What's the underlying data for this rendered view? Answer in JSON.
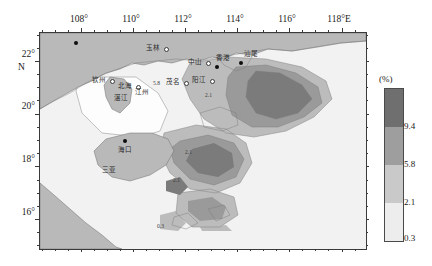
{
  "figure": {
    "name": "south-china-sea-percentage-contour-map",
    "axes": {
      "x_ticks": [
        {
          "label": "108°",
          "lon": 108
        },
        {
          "label": "110°",
          "lon": 110
        },
        {
          "label": "112°",
          "lon": 112
        },
        {
          "label": "114°",
          "lon": 114
        },
        {
          "label": "116°",
          "lon": 116
        },
        {
          "label": "118°E",
          "lon": 118,
          "bold_suffix": "E"
        }
      ],
      "y_ticks": [
        {
          "label": "22°",
          "lat": 22,
          "sublabel": "N"
        },
        {
          "label": "20°",
          "lat": 20
        },
        {
          "label": "18°",
          "lat": 18
        },
        {
          "label": "16°",
          "lat": 16
        }
      ],
      "x_range": [
        106.4,
        118.9
      ],
      "y_range": [
        14.9,
        23.1
      ]
    },
    "colorbar": {
      "title": "(%)",
      "ticks": [
        "9.4",
        "5.8",
        "2.1",
        "0.3"
      ],
      "band_colors": [
        "#6f6f6f",
        "#9e9e9e",
        "#c9c9c9",
        "#ededed"
      ]
    },
    "places": [
      {
        "name": "玉林",
        "marker": "open",
        "x": 106,
        "y": 16
      },
      {
        "name": "钦州",
        "marker": "open",
        "x": 59,
        "y": 48
      },
      {
        "name": "北海",
        "marker": "open",
        "x": 84,
        "y": 52
      },
      {
        "name": "江州",
        "marker": "none",
        "x": 101,
        "y": 55
      },
      {
        "name": "茂名",
        "marker": "open",
        "x": 133,
        "y": 50
      },
      {
        "name": "阳江",
        "marker": "open",
        "x": 158,
        "y": 48
      },
      {
        "name": "湛江",
        "marker": "open",
        "x": 121,
        "y": 62
      },
      {
        "name": "中山",
        "marker": "open",
        "x": 188,
        "y": 41
      },
      {
        "name": "香港",
        "marker": "solid",
        "x": 214,
        "y": 39
      },
      {
        "name": "汕尾",
        "marker": "none",
        "x": 240,
        "y": 34
      },
      {
        "name": "海口",
        "marker": "solid",
        "x": 113,
        "y": 121
      },
      {
        "name": "三亚",
        "marker": "none",
        "x": 96,
        "y": 153
      },
      {
        "name": "南宁",
        "marker": "solid",
        "x": 74,
        "y": 36
      }
    ],
    "contour_labels": [
      {
        "value": "2.1",
        "x": 204,
        "y": 91
      },
      {
        "value": "2.1",
        "x": 172,
        "y": 176
      },
      {
        "value": "2.1",
        "x": 184,
        "y": 148
      },
      {
        "value": "5.8",
        "x": 152,
        "y": 79
      },
      {
        "value": "0.3",
        "x": 156,
        "y": 222
      }
    ]
  },
  "chart_data": {
    "type": "heatmap",
    "xlabel": "Longitude (°E)",
    "ylabel": "Latitude (°N)",
    "xlim": [
      106.4,
      118.9
    ],
    "ylim": [
      14.9,
      23.1
    ],
    "grid": false,
    "legend_position": "right-outside",
    "colorbar_unit": "%",
    "contour_levels": [
      0.3,
      2.1,
      5.8,
      9.4
    ],
    "level_colors": [
      "#ededed",
      "#c9c9c9",
      "#9e9e9e",
      "#6f6f6f"
    ],
    "legend_entries": [
      {
        "label": "9.4",
        "color": "#6f6f6f",
        "range": "> 9.4"
      },
      {
        "label": "5.8",
        "color": "#9e9e9e",
        "range": "5.8 - 9.4"
      },
      {
        "label": "2.1",
        "color": "#c9c9c9",
        "range": "2.1 - 5.8"
      },
      {
        "label": "0.3",
        "color": "#ededed",
        "range": "0.3 - 2.1"
      }
    ],
    "annotations": [
      {
        "text": "2.1",
        "lon": 112.8,
        "lat": 20.9,
        "type": "contour-label"
      },
      {
        "text": "2.1",
        "lon": 111.5,
        "lat": 17.7,
        "type": "contour-label"
      },
      {
        "text": "0.3",
        "lon": 110.9,
        "lat": 15.9,
        "type": "contour-label"
      }
    ],
    "regions": [
      {
        "name": "east-of-Pearl-River-Estuary high band",
        "lon_center": 114.6,
        "lat_center": 21.3,
        "value_band": "> 9.4"
      },
      {
        "name": "central-shelf high patch",
        "lon_center": 112.5,
        "lat_center": 18.8,
        "value_band": "> 9.4"
      },
      {
        "name": "Hainan-east moderate belt",
        "lon_center": 111.8,
        "lat_center": 19.3,
        "value_band": "5.8 - 9.4"
      },
      {
        "name": "Beibu-Gulf-mouth low area",
        "lon_center": 109.0,
        "lat_center": 20.5,
        "value_band": "< 0.3"
      },
      {
        "name": "southern shelf low area",
        "lon_center": 111.2,
        "lat_center": 16.4,
        "value_band": "0.3 - 2.1"
      }
    ]
  }
}
